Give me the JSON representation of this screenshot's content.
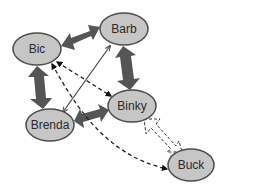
{
  "diagram": {
    "type": "relationship-graph",
    "colors": {
      "background": "#ffffff",
      "node_fill": "#c6c6c6",
      "node_stroke": "#4d4d4d",
      "thick_arrow": "#555555",
      "thin_line": "#444444",
      "dashed_line": "#222222",
      "label": "#2a2a2a"
    },
    "nodes": [
      {
        "id": "bic",
        "label": "Bic",
        "cx": 37,
        "cy": 49,
        "rx": 24,
        "ry": 16
      },
      {
        "id": "barb",
        "label": "Barb",
        "cx": 124,
        "cy": 29,
        "rx": 24,
        "ry": 16
      },
      {
        "id": "binky",
        "label": "Binky",
        "cx": 132,
        "cy": 106,
        "rx": 24,
        "ry": 16
      },
      {
        "id": "brenda",
        "label": "Brenda",
        "cx": 50,
        "cy": 125,
        "rx": 24,
        "ry": 16
      },
      {
        "id": "buck",
        "label": "Buck",
        "cx": 191,
        "cy": 165,
        "rx": 23,
        "ry": 16
      }
    ],
    "edges": [
      {
        "from": "bic",
        "to": "barb",
        "style": "thick-double-arrow"
      },
      {
        "from": "barb",
        "to": "binky",
        "style": "thick-double-arrow"
      },
      {
        "from": "bic",
        "to": "brenda",
        "style": "thick-double-arrow"
      },
      {
        "from": "brenda",
        "to": "binky",
        "style": "thick-double-arrow"
      },
      {
        "from": "brenda",
        "to": "barb",
        "style": "thin-solid-double-arrow"
      },
      {
        "from": "bic",
        "to": "binky",
        "style": "dashed-double-arrow"
      },
      {
        "from": "bic",
        "to": "buck",
        "style": "dashed-curved-double-arrow"
      },
      {
        "from": "binky",
        "to": "buck",
        "style": "hollow-dashed-double-arrow"
      }
    ]
  }
}
